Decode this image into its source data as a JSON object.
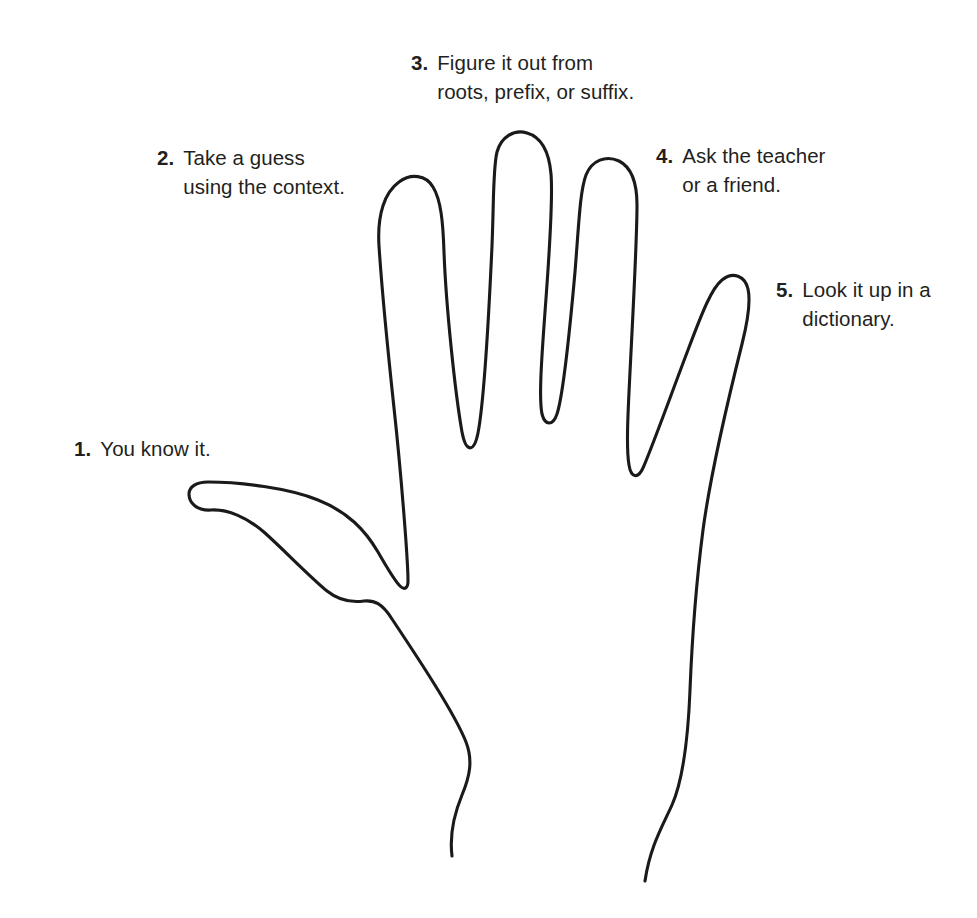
{
  "diagram": {
    "background_color": "#ffffff",
    "ink_color": "#1a1a1a",
    "text_color": "#231f20"
  },
  "callouts": [
    {
      "id": "1",
      "number": "1.",
      "finger": "thumb",
      "lines": [
        "You know it."
      ]
    },
    {
      "id": "2",
      "number": "2.",
      "finger": "index",
      "lines": [
        "Take a guess",
        "using the context."
      ]
    },
    {
      "id": "3",
      "number": "3.",
      "finger": "middle",
      "lines": [
        "Figure it out from",
        "roots, prefix, or suffix."
      ]
    },
    {
      "id": "4",
      "number": "4.",
      "finger": "ring",
      "lines": [
        "Ask the teacher",
        "or a friend."
      ]
    },
    {
      "id": "5",
      "number": "5.",
      "finger": "pinky",
      "lines": [
        "Look it up in a",
        "dictionary."
      ]
    }
  ]
}
